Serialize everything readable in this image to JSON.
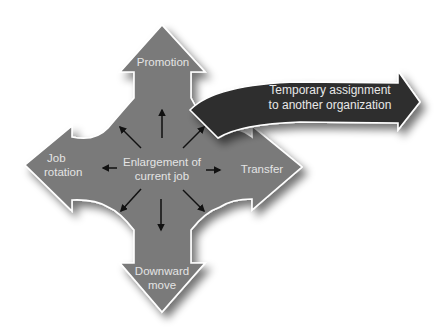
{
  "diagram": {
    "colors": {
      "cross_fill": "#7a7a7a",
      "cross_stroke": "#ffffff",
      "dark_arrow_fill": "#2e2e2e",
      "small_arrows": "#111111",
      "text": "#e6e6e6",
      "background": "#ffffff"
    },
    "center": {
      "label_line1": "Enlargement of",
      "label_line2": "current job"
    },
    "arrows": {
      "up": {
        "label": "Promotion"
      },
      "left": {
        "label_line1": "Job",
        "label_line2": "rotation"
      },
      "right": {
        "label": "Transfer"
      },
      "down": {
        "label_line1": "Downward",
        "label_line2": "move"
      },
      "external": {
        "label_line1": "Temporary assignment",
        "label_line2": "to another organization"
      }
    },
    "radiating_arrows": [
      "up",
      "up-right",
      "right",
      "down-right",
      "down",
      "down-left",
      "left",
      "up-left"
    ]
  }
}
